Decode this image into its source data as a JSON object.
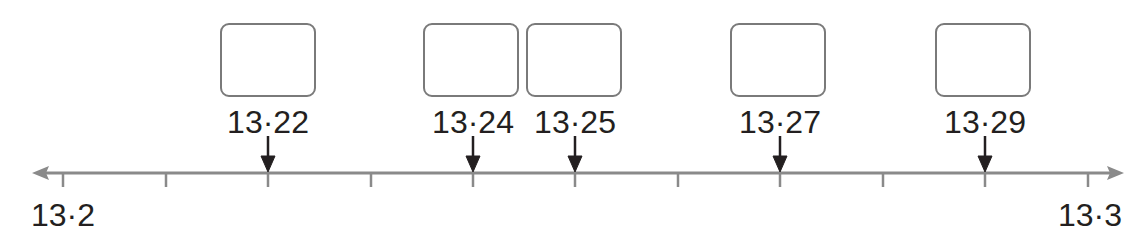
{
  "number_line": {
    "start": 13.2,
    "end": 13.3,
    "step": 0.01,
    "start_label": "13·2",
    "end_label": "13·3",
    "tick_count": 11,
    "axis_color": "#8a8a8a",
    "arrow_color": "#231f20"
  },
  "marked_points": [
    {
      "value": 13.22,
      "label": "13·22",
      "box_content": ""
    },
    {
      "value": 13.24,
      "label": "13·24",
      "box_content": ""
    },
    {
      "value": 13.25,
      "label": "13·25",
      "box_content": ""
    },
    {
      "value": 13.27,
      "label": "13·27",
      "box_content": ""
    },
    {
      "value": 13.29,
      "label": "13·29",
      "box_content": ""
    }
  ]
}
